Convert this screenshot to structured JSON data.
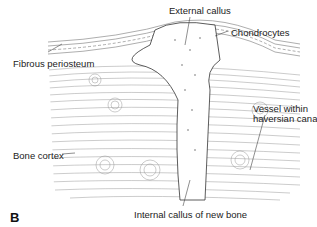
{
  "figure": {
    "panel_letter": "B",
    "labels": {
      "external_callus": "External callus",
      "chondrocytes": "Chondrocytes",
      "fibrous_periosteum": "Fibrous periosteum",
      "vessel_line1": "Vessel within",
      "vessel_line2": "haversian canal",
      "bone_cortex": "Bone cortex",
      "internal_callus": "Internal callus of new bone"
    }
  }
}
